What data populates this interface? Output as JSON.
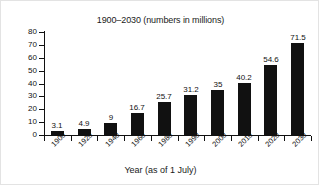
{
  "chart_data": {
    "type": "bar",
    "title": "1900–2030 (numbers in millions)",
    "xlabel": "Year (as of 1 July)",
    "ylabel": "",
    "categories": [
      "1900",
      "1920",
      "1940",
      "1960",
      "1980",
      "1990",
      "2000",
      "2010",
      "2020",
      "2030"
    ],
    "values": [
      3.1,
      4.9,
      9,
      16.7,
      25.7,
      31.2,
      35,
      40.2,
      54.6,
      71.5
    ],
    "value_labels": [
      "3.1",
      "4.9",
      "9",
      "16.7",
      "25.7",
      "31.2",
      "35",
      "40.2",
      "54.6",
      "71.5"
    ],
    "ylim": [
      0,
      80
    ],
    "yticks": [
      0,
      10,
      20,
      30,
      40,
      50,
      60,
      70,
      80
    ],
    "ytick_labels": [
      "0",
      "10",
      "20",
      "30",
      "40",
      "50",
      "60",
      "70",
      "80"
    ],
    "grid": false,
    "legend": false,
    "bar_color": "#111111",
    "background_color": "#ffffff"
  }
}
